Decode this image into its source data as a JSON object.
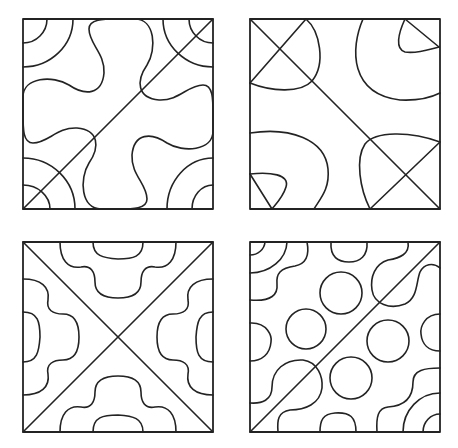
{
  "diagram": {
    "stroke_color": "#232323",
    "background": "#ffffff",
    "tiles": [
      {
        "id": "tile-top-left",
        "pattern": "cross-blob-with-corner-arcs",
        "left": 23,
        "top": 19,
        "paths": [
          "M0,190 L190,0",
          "M24,0 A24,24 0 0 1 0,24",
          "M50,0 A50,48 0 0 1 0,48",
          "M166,0 A24,24 0 0 0 190,24",
          "M140,0 A50,48 0 0 0 190,48",
          "M0,166 A27,24 0 0 1 27,190",
          "M0,139 A52,51 0 0 1 52,190",
          "M190,166 A21,24 0 0 0 169,190",
          "M190,139 A46,51 0 0 0 144,190",
          "M95,0 L112,0 C132,0 134,30 124,46 C113,62 114,79 136,81 C156,82 165,66 180,66 C190,66 190,80 190,95 L190,112 C190,132 160,134 144,124 C128,113 111,114 109,136 C108,156 124,165 124,180 C124,190 110,190 95,190 L78,190 C58,190 56,160 66,144 C77,128 76,111 54,109 C34,108 25,124 10,124 C0,124 0,110 0,95 L0,78 C0,58 30,56 46,66 C62,77 79,76 81,54 C82,34 66,25 66,10 C66,0 80,0 95,0 Z"
        ],
        "circles": []
      },
      {
        "id": "tile-top-right",
        "pattern": "diagonal-with-corner-teardrops",
        "left": 250,
        "top": 19,
        "paths": [
          "M0,0 L190,190",
          "M56,0 L0,64",
          "M56,0 C70,12 76,45 62,62 C50,75 20,72 0,64",
          "M155,0 L189,28",
          "M155,0 C148,15 145,30 155,33 C168,35 180,30 189,28",
          "M113,0 C100,30 100,75 150,81 C170,82 182,78 190,74",
          "M0,114 C40,108 75,120 78,150 C80,170 70,180 64,190",
          "M0,155 L22,190",
          "M0,155 C20,153 40,155 36,168 C33,178 26,185 22,190",
          "M190,123 L120,190",
          "M190,123 C160,112 125,112 115,125 C105,140 110,170 120,190"
        ],
        "circles": []
      },
      {
        "id": "tile-bottom-left",
        "pattern": "x-diagonals-with-edge-motifs",
        "left": 23,
        "top": 242,
        "paths": [
          "M0,0 L190,190",
          "M190,0 L0,190",
          "M37,0 C37,18 45,27 58,25 C68,23 72,30 72,40 C72,52 82,56 95,56 C108,56 118,52 118,40 C118,30 122,23 132,25 C145,27 153,18 153,0",
          "M70,0 C70,14 80,16 95,17 C110,17 120,15 120,0",
          "M190,37 C172,37 163,45 165,58 C167,68 160,72 150,72 C138,72 134,82 134,95 C134,108 138,118 150,118 C160,118 167,122 165,132 C163,145 172,153 190,153",
          "M190,70 C176,70 174,80 173,95 C173,110 175,120 190,120",
          "M153,190 C153,172 145,163 132,165 C122,167 118,160 118,150 C118,138 108,134 95,134 C82,134 72,138 72,150 C72,160 68,167 58,165 C45,163 37,172 37,190",
          "M120,190 C120,176 110,174 95,173 C80,173 70,175 70,190",
          "M0,153 C18,153 27,145 25,132 C23,122 30,118 40,118 C52,118 56,108 56,95 C56,82 52,72 40,72 C30,72 23,68 25,58 C27,45 18,37 0,37",
          "M0,120 C14,120 16,110 17,95 C17,80 15,70 0,70"
        ],
        "circles": []
      },
      {
        "id": "tile-bottom-right",
        "pattern": "diagonal-with-circles-and-wiggles",
        "left": 250,
        "top": 242,
        "paths": [
          "M0,190 L190,0",
          "M15,0 A15,14 0 0 1 0,13",
          "M37,0 A37,32 0 0 1 0,31",
          "M57,0 C60,15 55,22 45,24 C30,26 26,32 27,42 C28,52 22,60 0,58",
          "M0,81 C18,80 22,95 21,100 C20,112 12,119 0,119",
          "M81,0 C80,15 88,20 99,20 C110,20 118,14 117,0",
          "M190,72 C175,72 170,85 171,92 C172,102 178,109 190,109",
          "M70,190 C70,178 73,172 85,171 C100,170 106,175 106,190",
          "M158,0 C160,12 150,16 138,18 C125,22 120,35 122,48 C124,62 140,68 155,62 C168,56 166,40 170,30 C174,22 183,20 190,26",
          "M0,161 C12,162 22,158 22,145 C22,128 35,117 53,118 C68,120 73,135 72,146 C70,162 55,168 40,168 C28,170 27,178 28,190",
          "M190,126 C175,126 163,128 163,140 C163,155 155,164 138,165 C128,166 126,175 127,190",
          "M190,151 A37,39 0 0 0 153,190",
          "M190,172 A17,18 0 0 0 173,190"
        ],
        "circles": [
          {
            "cx": 91,
            "cy": 51,
            "r": 21
          },
          {
            "cx": 56,
            "cy": 87,
            "r": 20
          },
          {
            "cx": 138,
            "cy": 99,
            "r": 21
          },
          {
            "cx": 101,
            "cy": 136,
            "r": 21
          }
        ]
      }
    ]
  }
}
